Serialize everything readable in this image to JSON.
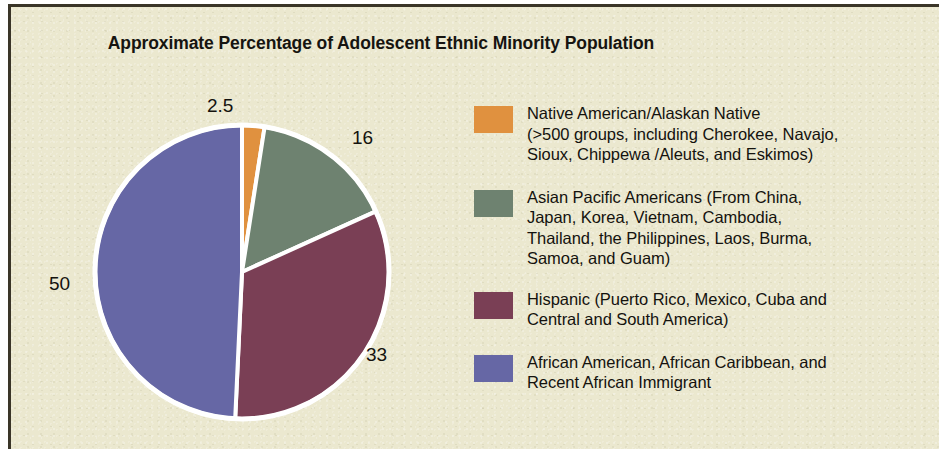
{
  "figure": {
    "background_color": "#ebe8cf",
    "border_color": "#3a3528"
  },
  "chart_data": {
    "type": "pie",
    "title": "Approximate Percentage of Adolescent Ethnic Minority Population",
    "xlabel": "",
    "ylabel": "",
    "units": "percent",
    "start_angle_deg": 0,
    "direction": "clockwise",
    "slice_separator_color": "#ffffff",
    "legend_position": "right",
    "grid": false,
    "categories": [
      "Native American/Alaskan Native",
      "Asian Pacific Americans",
      "Hispanic",
      "African American, African Caribbean, and Recent African Immigrant"
    ],
    "values": [
      2.5,
      16,
      33,
      50
    ],
    "data_labels": [
      "2.5",
      "16",
      "33",
      "50"
    ],
    "colors": [
      "#e0913f",
      "#6e8270",
      "#7a3f55",
      "#6667a5"
    ],
    "legend_entries": [
      {
        "color": "#e0913f",
        "value": 2.5,
        "label": "Native American/Alaskan Native\n(>500 groups, including Cherokee, Navajo,\nSioux, Chippewa /Aleuts, and Eskimos)"
      },
      {
        "color": "#6e8270",
        "value": 16,
        "label": "Asian Pacific Americans (From China,\nJapan, Korea, Vietnam, Cambodia,\nThailand, the Philippines, Laos, Burma,\nSamoa, and Guam)"
      },
      {
        "color": "#7a3f55",
        "value": 33,
        "label": "Hispanic (Puerto Rico, Mexico, Cuba and\nCentral and South America)"
      },
      {
        "color": "#6667a5",
        "value": 50,
        "label": "African American, African Caribbean, and\nRecent African Immigrant"
      }
    ]
  }
}
